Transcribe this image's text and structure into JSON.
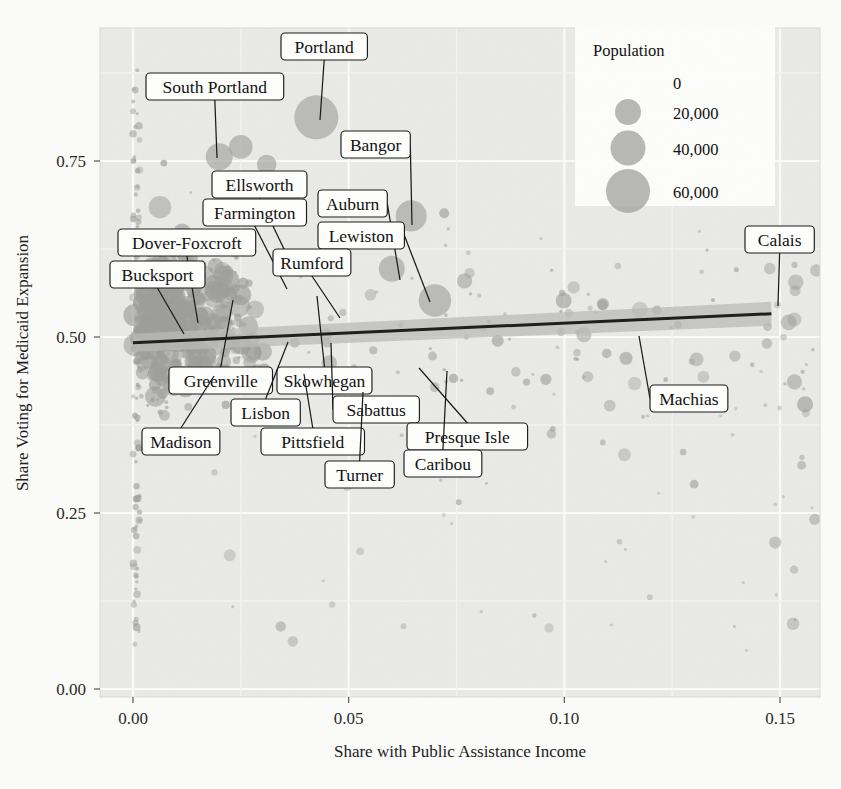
{
  "chart_data": {
    "type": "scatter",
    "title": "",
    "xlabel": "Share with Public Assistance Income",
    "ylabel": "Share Voting for Medicaid Expansion",
    "xlim": [
      -0.006,
      0.166
    ],
    "ylim": [
      -0.02,
      0.93
    ],
    "xticks": [
      "0.00",
      "0.05",
      "0.10",
      "0.15"
    ],
    "xtick_values": [
      0.0,
      0.05,
      0.1,
      0.15
    ],
    "yticks": [
      "0.00",
      "0.25",
      "0.50",
      "0.75"
    ],
    "ytick_values": [
      0.0,
      0.25,
      0.5,
      0.75
    ],
    "grid": true,
    "legend": {
      "title": "Population",
      "position": "top-right",
      "entries": [
        {
          "label": "0",
          "value": 0
        },
        {
          "label": "20,000",
          "value": 20000
        },
        {
          "label": "40,000",
          "value": 40000
        },
        {
          "label": "60,000",
          "value": 60000
        }
      ]
    },
    "size_encoding": "Population",
    "trendline": {
      "type": "linear",
      "x": [
        0.0,
        0.148
      ],
      "y": [
        0.492,
        0.533
      ],
      "band": true
    },
    "annotations": [
      {
        "label": "Portland",
        "x": 0.0425,
        "y": 0.812,
        "pop": 66000,
        "box_x": 281,
        "box_y": 33,
        "anchor_x": 320,
        "anchor_y": 120
      },
      {
        "label": "South Portland",
        "x": 0.02,
        "y": 0.756,
        "pop": 25000,
        "box_x": 146,
        "box_y": 73,
        "anchor_x": 217,
        "anchor_y": 158
      },
      {
        "label": "Bangor",
        "x": 0.0645,
        "y": 0.672,
        "pop": 33000,
        "box_x": 341,
        "box_y": 131,
        "anchor_x": 412,
        "anchor_y": 225
      },
      {
        "label": "Ellsworth",
        "x": 0.038,
        "y": 0.586,
        "pop": 8000,
        "box_x": 212,
        "box_y": 171,
        "anchor_x": 297,
        "anchor_y": 276
      },
      {
        "label": "Auburn",
        "x": 0.06,
        "y": 0.597,
        "pop": 23000,
        "box_x": 318,
        "box_y": 190,
        "anchor_x": 400,
        "anchor_y": 280
      },
      {
        "label": "Farmington",
        "x": 0.0355,
        "y": 0.566,
        "pop": 7700,
        "box_x": 203,
        "box_y": 199,
        "anchor_x": 287,
        "anchor_y": 289
      },
      {
        "label": "Lewiston",
        "x": 0.07,
        "y": 0.552,
        "pop": 36000,
        "box_x": 318,
        "box_y": 222,
        "anchor_x": 430,
        "anchor_y": 302
      },
      {
        "label": "Dover-Foxcroft",
        "x": 0.015,
        "y": 0.528,
        "pop": 4200,
        "box_x": 118,
        "box_y": 229,
        "anchor_x": 198,
        "anchor_y": 323
      },
      {
        "label": "Rumford",
        "x": 0.047,
        "y": 0.531,
        "pop": 5800,
        "box_x": 273,
        "box_y": 249,
        "anchor_x": 340,
        "anchor_y": 318
      },
      {
        "label": "Bucksport",
        "x": 0.013,
        "y": 0.51,
        "pop": 4900,
        "box_x": 110,
        "box_y": 261,
        "anchor_x": 184,
        "anchor_y": 334
      },
      {
        "label": "Calais",
        "x": 0.148,
        "y": 0.533,
        "pop": 3100,
        "box_x": 745,
        "box_y": 226,
        "anchor_x": 778,
        "anchor_y": 306
      },
      {
        "label": "Greenville",
        "x": 0.023,
        "y": 0.446,
        "pop": 1600,
        "box_x": 169,
        "box_y": 367,
        "anchor_x": 233,
        "anchor_y": 300
      },
      {
        "label": "Skowhegan",
        "x": 0.039,
        "y": 0.455,
        "pop": 8600,
        "box_x": 277,
        "box_y": 367,
        "anchor_x": 317,
        "anchor_y": 296
      },
      {
        "label": "Machias",
        "x": 0.124,
        "y": 0.473,
        "pop": 2200,
        "box_x": 650,
        "box_y": 385,
        "anchor_x": 639,
        "anchor_y": 336
      },
      {
        "label": "Lisbon",
        "x": 0.033,
        "y": 0.437,
        "pop": 9000,
        "box_x": 231,
        "box_y": 399,
        "anchor_x": 288,
        "anchor_y": 342
      },
      {
        "label": "Sabattus",
        "x": 0.046,
        "y": 0.432,
        "pop": 4800,
        "box_x": 333,
        "box_y": 396,
        "anchor_x": 331,
        "anchor_y": 343
      },
      {
        "label": "Presque Isle",
        "x": 0.07,
        "y": 0.456,
        "pop": 9300,
        "box_x": 407,
        "box_y": 423,
        "anchor_x": 419,
        "anchor_y": 368
      },
      {
        "label": "Madison",
        "x": 0.027,
        "y": 0.412,
        "pop": 4800,
        "box_x": 142,
        "box_y": 428,
        "anchor_x": 214,
        "anchor_y": 376
      },
      {
        "label": "Pittsfield",
        "x": 0.037,
        "y": 0.412,
        "pop": 4200,
        "box_x": 261,
        "box_y": 428,
        "anchor_x": 304,
        "anchor_y": 374
      },
      {
        "label": "Caribou",
        "x": 0.0755,
        "y": 0.43,
        "pop": 8200,
        "box_x": 404,
        "box_y": 450,
        "anchor_x": 447,
        "anchor_y": 371
      },
      {
        "label": "Turner",
        "x": 0.053,
        "y": 0.404,
        "pop": 5800,
        "box_x": 325,
        "box_y": 461,
        "anchor_x": 363,
        "anchor_y": 392
      }
    ]
  }
}
